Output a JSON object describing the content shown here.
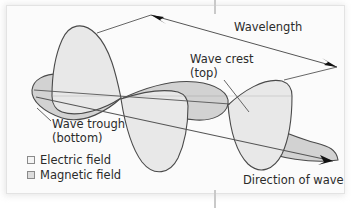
{
  "figure": {
    "background_color": "#fbfbfb",
    "plate_border_color": "#e3e3e3",
    "stroke_color": "#4a4a4a",
    "text_color": "#2b2b2b"
  },
  "labels": {
    "wavelength": "Wavelength",
    "wave_crest": "Wave crest",
    "wave_crest_sub": "(top)",
    "wave_trough": "Wave trough",
    "wave_trough_sub": "(bottom)",
    "direction_of_wave": "Direction of wave"
  },
  "legend": {
    "items": [
      {
        "label": "Electric field",
        "swatch_fill": "#f4f4f4",
        "swatch_border": "#8a8a8a"
      },
      {
        "label": "Magnetic field",
        "swatch_fill": "#dcdcdc",
        "swatch_border": "#8a8a8a"
      }
    ]
  },
  "diagram_data": {
    "type": "diagram",
    "subject": "transverse electromagnetic wave with two perpendicular oscillating field planes",
    "wave_count": 2,
    "wavelengths_shown": 1,
    "electric_field_fill": "#e8e8e8",
    "magnetic_field_fill": "#d2d2d2",
    "axis_line_color": "#555555",
    "annotations": [
      {
        "name": "wavelength-measure",
        "kind": "double-headed-arrow",
        "from": [
          148,
          14
        ],
        "to": [
          340,
          68
        ]
      },
      {
        "name": "wave-crest-leader",
        "kind": "leader-line",
        "from": [
          222,
          80
        ],
        "to": [
          248,
          112
        ]
      },
      {
        "name": "wave-trough-leader",
        "kind": "leader-line",
        "from": [
          50,
          122
        ],
        "to": [
          36,
          110
        ]
      },
      {
        "name": "direction-arrow",
        "kind": "single-headed-arrow",
        "from": [
          36,
          97
        ],
        "to": [
          339,
          163
        ]
      }
    ]
  }
}
